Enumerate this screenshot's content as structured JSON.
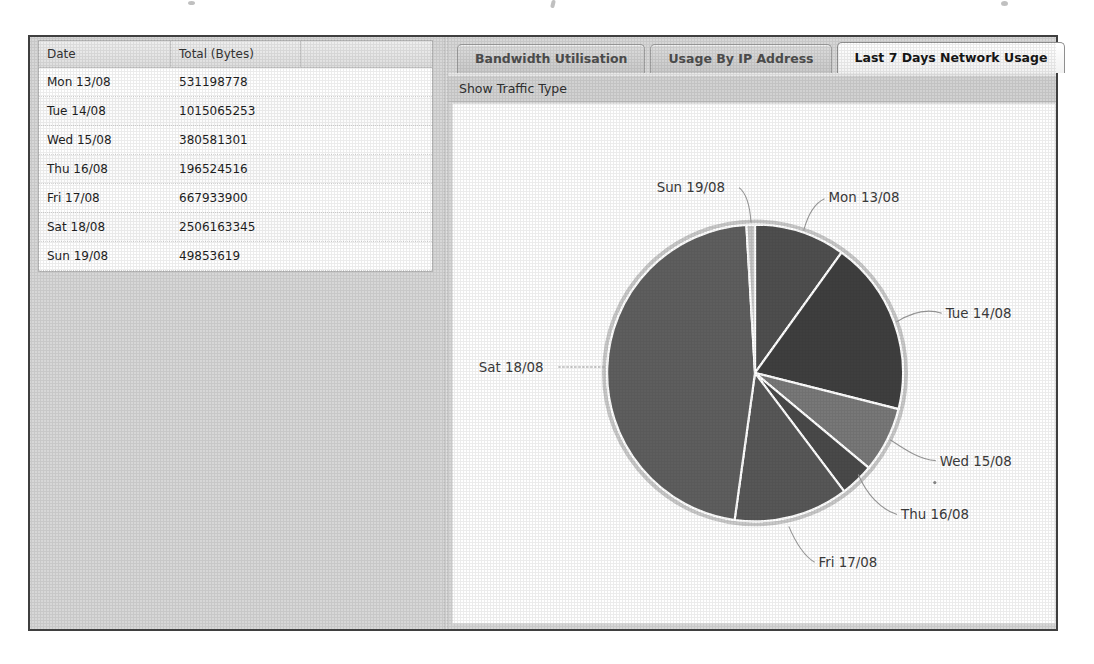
{
  "table": {
    "columns": [
      "Date",
      "Total (Bytes)",
      ""
    ],
    "rows": [
      [
        "Mon 13/08",
        "531198778"
      ],
      [
        "Tue 14/08",
        "1015065253"
      ],
      [
        "Wed 15/08",
        "380581301"
      ],
      [
        "Thu 16/08",
        "196524516"
      ],
      [
        "Fri 17/08",
        "667933900"
      ],
      [
        "Sat 18/08",
        "2506163345"
      ],
      [
        "Sun 19/08",
        "49853619"
      ]
    ]
  },
  "tabs": [
    {
      "label": "Bandwidth Utilisation",
      "active": false
    },
    {
      "label": "Usage By IP Address",
      "active": false
    },
    {
      "label": "Last 7 Days Network Usage",
      "active": true
    }
  ],
  "toolbar": {
    "show_traffic_type": "Show Traffic Type"
  },
  "chart_data": {
    "type": "pie",
    "title": "Last 7 Days Network Usage",
    "categories": [
      "Mon 13/08",
      "Tue 14/08",
      "Wed 15/08",
      "Thu 16/08",
      "Fri 17/08",
      "Sat 18/08",
      "Sun 19/08"
    ],
    "values": [
      531198778,
      1015065253,
      380581301,
      196524516,
      667933900,
      2506163345,
      49853619
    ],
    "total_bytes": 5347320712,
    "unit": "bytes",
    "direction": "clockwise",
    "start_angle": "12-oclock",
    "labels_position": "outside-with-leader-lines",
    "slice_colors": [
      "#4e4e4e",
      "#3e3e3e",
      "#787878",
      "#494949",
      "#575757",
      "#5e5e5e",
      "#c6c6c6"
    ],
    "separator_color": "#ffffff",
    "rim_color": "#c9c9c9",
    "label_color": "#3a3a3a",
    "legend": "none"
  },
  "colors": {
    "app_background": "#d7d7d7",
    "window_border": "#3f3f3f",
    "table_header_bg": "#e6e6e6",
    "active_tab_bg": "#fafafa",
    "inactive_tab_bg": "#d0d0d0"
  }
}
